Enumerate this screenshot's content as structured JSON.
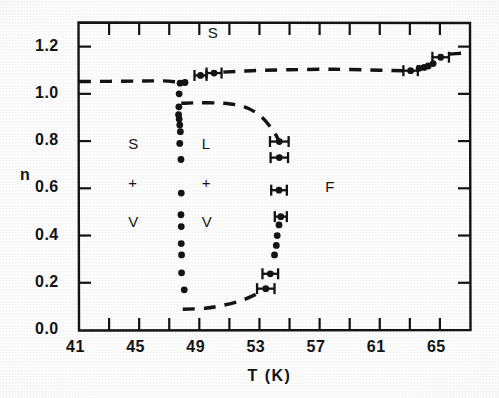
{
  "figure": {
    "kind": "phase-diagram",
    "ink_color": "#141414",
    "paper_color": "#ffffff"
  },
  "axes": {
    "x_title": "T (K)",
    "y_title": "n",
    "x_ticks": [
      "41",
      "45",
      "49",
      "53",
      "57",
      "61",
      "65"
    ],
    "y_ticks": [
      "0.0",
      "0.2",
      "0.4",
      "0.6",
      "0.8",
      "1.0",
      "1.2"
    ]
  },
  "regions": [
    {
      "name": "solid",
      "label": "S",
      "x": 49.9,
      "y": 1.255
    },
    {
      "name": "solid-vapor",
      "label": "S",
      "x": 44.6,
      "y": 0.785
    },
    {
      "name": "solid-vapor-plus",
      "label": "+",
      "x": 44.6,
      "y": 0.62
    },
    {
      "name": "solid-vapor-v",
      "label": "V",
      "x": 44.6,
      "y": 0.455
    },
    {
      "name": "liquid-vapor",
      "label": "L",
      "x": 49.5,
      "y": 0.785
    },
    {
      "name": "liquid-vapor-plus",
      "label": "+",
      "x": 49.5,
      "y": 0.62
    },
    {
      "name": "liquid-vapor-v",
      "label": "V",
      "x": 49.5,
      "y": 0.455
    },
    {
      "name": "fluid",
      "label": "F",
      "x": 57.7,
      "y": 0.6
    }
  ],
  "chart_data": {
    "type": "scatter",
    "title": "",
    "xlabel": "T (K)",
    "ylabel": "n",
    "xlim": [
      41,
      67
    ],
    "ylim": [
      0.0,
      1.3
    ],
    "x_major_step": 4,
    "x_minor_step": 2,
    "y_major_step": 0.2,
    "grid": false,
    "legend": null,
    "series": [
      {
        "name": "solid-branch-left",
        "marker": "filled-circle",
        "points": [
          {
            "x": 47.72,
            "y": 1.045
          },
          {
            "x": 48.05,
            "y": 1.048
          },
          {
            "x": 47.66,
            "y": 1.0
          },
          {
            "x": 47.64,
            "y": 0.945
          },
          {
            "x": 47.62,
            "y": 0.912
          },
          {
            "x": 47.66,
            "y": 0.893
          },
          {
            "x": 47.7,
            "y": 0.868
          },
          {
            "x": 47.74,
            "y": 0.84
          },
          {
            "x": 47.7,
            "y": 0.79
          },
          {
            "x": 47.78,
            "y": 0.722
          },
          {
            "x": 47.8,
            "y": 0.58
          },
          {
            "x": 47.78,
            "y": 0.488
          },
          {
            "x": 47.8,
            "y": 0.438
          },
          {
            "x": 47.8,
            "y": 0.366
          },
          {
            "x": 47.82,
            "y": 0.318
          },
          {
            "x": 47.82,
            "y": 0.242
          },
          {
            "x": 48.0,
            "y": 0.17
          }
        ]
      },
      {
        "name": "fluid-branch-right",
        "marker": "filled-circle",
        "points": [
          {
            "x": 54.32,
            "y": 0.798,
            "xerr": 0.62
          },
          {
            "x": 54.32,
            "y": 0.73,
            "xerr": 0.58
          },
          {
            "x": 54.3,
            "y": 0.592,
            "xerr": 0.52
          },
          {
            "x": 54.42,
            "y": 0.48,
            "xerr": 0.4
          },
          {
            "x": 54.3,
            "y": 0.445
          },
          {
            "x": 54.18,
            "y": 0.4
          },
          {
            "x": 54.12,
            "y": 0.358
          },
          {
            "x": 54.0,
            "y": 0.318
          },
          {
            "x": 53.72,
            "y": 0.238,
            "xerr": 0.52
          },
          {
            "x": 53.42,
            "y": 0.175,
            "xerr": 0.58
          }
        ]
      },
      {
        "name": "solid-upper-boundary-points",
        "marker": "filled-circle",
        "points": [
          {
            "x": 49.08,
            "y": 1.078,
            "xerr": 0.4
          },
          {
            "x": 49.98,
            "y": 1.088,
            "xerr": 0.5
          },
          {
            "x": 63.05,
            "y": 1.098,
            "xerr": 0.48
          },
          {
            "x": 63.62,
            "y": 1.108
          },
          {
            "x": 63.95,
            "y": 1.112
          },
          {
            "x": 64.22,
            "y": 1.118
          },
          {
            "x": 64.55,
            "y": 1.128
          },
          {
            "x": 65.05,
            "y": 1.155,
            "xerr": 0.55
          }
        ]
      }
    ],
    "dashed_curves": [
      {
        "name": "solid-vapor-upper-boundary",
        "points": [
          [
            41.0,
            1.052
          ],
          [
            43.0,
            1.053
          ],
          [
            45.0,
            1.054
          ],
          [
            46.6,
            1.055
          ],
          [
            47.5,
            1.05
          ]
        ]
      },
      {
        "name": "solid-fluid-boundary-upper",
        "points": [
          [
            50.6,
            1.092
          ],
          [
            52.5,
            1.098
          ],
          [
            55.0,
            1.102
          ],
          [
            58.0,
            1.104
          ],
          [
            61.0,
            1.1
          ],
          [
            62.6,
            1.098
          ]
        ]
      },
      {
        "name": "fluid-boundary-high-T",
        "points": [
          [
            65.6,
            1.168
          ],
          [
            66.5,
            1.172
          ],
          [
            67.0,
            1.173
          ]
        ]
      },
      {
        "name": "liquid-vapor-dome-top",
        "points": [
          [
            47.8,
            0.96
          ],
          [
            49.0,
            0.962
          ],
          [
            50.6,
            0.96
          ],
          [
            52.0,
            0.945
          ],
          [
            53.1,
            0.905
          ],
          [
            53.9,
            0.845
          ],
          [
            54.3,
            0.8
          ]
        ]
      },
      {
        "name": "liquid-vapor-dome-bottom",
        "points": [
          [
            47.9,
            0.088
          ],
          [
            49.4,
            0.092
          ],
          [
            50.6,
            0.105
          ],
          [
            51.8,
            0.125
          ],
          [
            52.8,
            0.152
          ],
          [
            53.4,
            0.172
          ]
        ]
      }
    ]
  }
}
